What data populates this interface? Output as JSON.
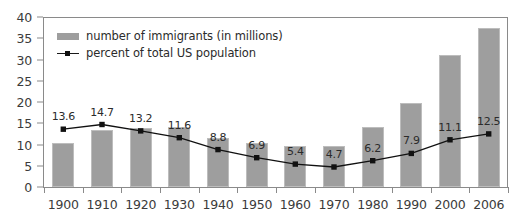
{
  "chart_data": {
    "type": "bar",
    "title": "",
    "xlabel": "",
    "ylabel": "",
    "ylim": [
      0,
      40
    ],
    "yticks": [
      0,
      5,
      10,
      15,
      20,
      25,
      30,
      35,
      40
    ],
    "grid": false,
    "legend_position": "top-left",
    "categories": [
      "1900",
      "1910",
      "1920",
      "1930",
      "1940",
      "1950",
      "1960",
      "1970",
      "1980",
      "1990",
      "2000",
      "2006"
    ],
    "series": [
      {
        "name": "number of immigrants (in millions)",
        "type": "bar",
        "color": "#9e9e9e",
        "values": [
          10.3,
          13.5,
          13.9,
          14.2,
          11.6,
          10.3,
          9.7,
          9.6,
          14.1,
          19.8,
          31.1,
          37.5
        ],
        "labels": [
          "",
          "",
          "",
          "",
          "",
          "",
          "",
          "",
          "",
          "",
          "",
          ""
        ]
      },
      {
        "name": "percent of total US population",
        "type": "line",
        "color": "#111111",
        "values": [
          13.6,
          14.7,
          13.2,
          11.6,
          8.8,
          6.9,
          5.4,
          4.7,
          6.2,
          7.9,
          11.1,
          12.5
        ],
        "labels": [
          "13.6",
          "14.7",
          "13.2",
          "11.6",
          "8.8",
          "6.9",
          "5.4",
          "4.7",
          "6.2",
          "7.9",
          "11.1",
          "12.5"
        ]
      }
    ]
  },
  "legend": {
    "entries": [
      {
        "label": "number of immigrants (in millions)",
        "marker": "bar-swatch-icon"
      },
      {
        "label": "percent of total US population",
        "marker": "line-marker-icon"
      }
    ]
  }
}
